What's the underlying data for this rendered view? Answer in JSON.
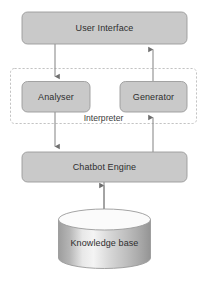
{
  "diagram": {
    "background_color": "#ffffff",
    "node_fill_color": "#c9c9c9",
    "node_border_color": "#9a9a9a",
    "connector_color": "#8c8c8c",
    "text_color": "#2e2e2e",
    "nodes": {
      "user_interface": {
        "label": "User Interface",
        "shape": "rounded-rectangle"
      },
      "analyser": {
        "label": "Analyser",
        "shape": "rounded-rectangle"
      },
      "generator": {
        "label": "Generator",
        "shape": "rounded-rectangle"
      },
      "chatbot_engine": {
        "label": "Chatbot Engine",
        "shape": "rounded-rectangle"
      },
      "knowledge_base": {
        "label": "Knowledge base",
        "shape": "cylinder"
      }
    },
    "groups": {
      "interpreter": {
        "label": "Interpreter",
        "shape": "dashed-rectangle"
      }
    },
    "connectors": [
      {
        "name": "user-interface-to-analyser",
        "from": "User Interface",
        "to": "Analyser",
        "direction": "down"
      },
      {
        "name": "analyser-to-chatbot-engine",
        "from": "Analyser",
        "to": "Chatbot Engine",
        "direction": "down"
      },
      {
        "name": "chatbot-engine-to-generator",
        "from": "Chatbot Engine",
        "to": "Generator",
        "direction": "up"
      },
      {
        "name": "generator-to-user-interface",
        "from": "Generator",
        "to": "User Interface",
        "direction": "up"
      },
      {
        "name": "chatbot-engine-knowledge-base",
        "from": "Chatbot Engine",
        "to": "Knowledge base",
        "direction": "bidirectional"
      }
    ]
  }
}
